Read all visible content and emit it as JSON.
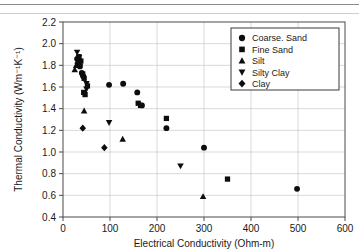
{
  "figure": {
    "background_color": "#ffffff",
    "marker_color": "#0d0d0d",
    "grid_color": "#c8c8c8",
    "frame_color": "#4a4a4a"
  },
  "chart_data": {
    "type": "scatter",
    "title": "",
    "xlabel": "Electrical Conductivity (Ohm-m)",
    "ylabel": "Thermal Conductivity (Wm⁻¹K⁻¹)",
    "xlim": [
      0,
      600
    ],
    "ylim": [
      0.4,
      2.2
    ],
    "xticks": [
      0,
      100,
      200,
      300,
      400,
      500,
      600
    ],
    "yticks": [
      0.4,
      0.6,
      0.8,
      1.0,
      1.2,
      1.4,
      1.6,
      1.8,
      2.0,
      2.2
    ],
    "xtick_labels": [
      "0",
      "100",
      "200",
      "300",
      "400",
      "500",
      "600"
    ],
    "ytick_labels": [
      "0.4",
      "0.6",
      "0.8",
      "1.0",
      "1.2",
      "1.4",
      "1.6",
      "1.8",
      "2.0",
      "2.2"
    ],
    "grid": true,
    "grid_axis": "y",
    "legend_position": "upper right",
    "series": [
      {
        "name": "Coarse. Sand",
        "marker": "circle",
        "points": [
          [
            30,
            1.86
          ],
          [
            33,
            1.82
          ],
          [
            36,
            1.79
          ],
          [
            40,
            1.73
          ],
          [
            43,
            1.7
          ],
          [
            98,
            1.62
          ],
          [
            128,
            1.63
          ],
          [
            158,
            1.55
          ],
          [
            168,
            1.43
          ],
          [
            220,
            1.22
          ],
          [
            300,
            1.04
          ],
          [
            498,
            0.66
          ]
        ]
      },
      {
        "name": "Fine Sand",
        "marker": "square",
        "points": [
          [
            34,
            1.88
          ],
          [
            38,
            1.84
          ],
          [
            42,
            1.72
          ],
          [
            45,
            1.68
          ],
          [
            44,
            1.55
          ],
          [
            47,
            1.53
          ],
          [
            52,
            1.61
          ],
          [
            160,
            1.45
          ],
          [
            165,
            1.43
          ],
          [
            220,
            1.31
          ],
          [
            350,
            0.75
          ]
        ]
      },
      {
        "name": "Silt",
        "marker": "triangle-up",
        "points": [
          [
            25,
            1.76
          ],
          [
            28,
            1.8
          ],
          [
            31,
            1.84
          ],
          [
            45,
            1.38
          ],
          [
            127,
            1.12
          ],
          [
            298,
            0.59
          ]
        ]
      },
      {
        "name": "Silty Clay",
        "marker": "triangle-down",
        "points": [
          [
            30,
            1.92
          ],
          [
            34,
            1.87
          ],
          [
            50,
            1.63
          ],
          [
            50,
            1.58
          ],
          [
            98,
            1.27
          ],
          [
            250,
            0.87
          ]
        ]
      },
      {
        "name": "Clay",
        "marker": "diamond",
        "points": [
          [
            32,
            1.85
          ],
          [
            36,
            1.81
          ],
          [
            42,
            1.22
          ],
          [
            88,
            1.04
          ]
        ]
      }
    ]
  }
}
